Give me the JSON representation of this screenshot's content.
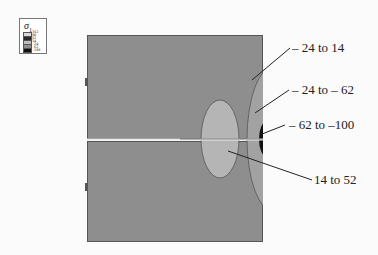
{
  "legend": {
    "symbol": "σ",
    "subscript": "1",
    "values": [
      "152",
      "90",
      "52",
      "14",
      "-24",
      "-62",
      "-100",
      "-112"
    ],
    "colors": [
      "#d8d8d8",
      "#2a2a2a",
      "#bcbcbc",
      "#a6a6a6",
      "#8e8e8e",
      "#b0b0b0",
      "#505050",
      "#111111"
    ]
  },
  "plot": {
    "plate_color": "#8e8e8e",
    "inner_region_color": "#b4b4b4",
    "edge_region_color": "#a0a0a0",
    "tip_region_color": "#111111"
  },
  "annotations": [
    {
      "label": "– 24 to 14"
    },
    {
      "label": "– 24 to – 62"
    },
    {
      "label": "– 62 to –100"
    },
    {
      "label": "14 to 52"
    }
  ]
}
